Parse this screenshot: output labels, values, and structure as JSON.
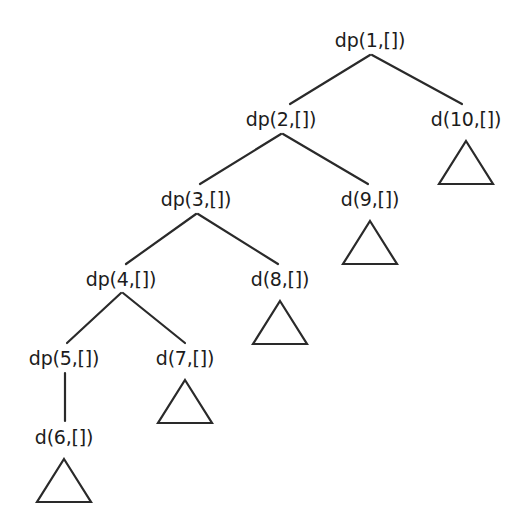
{
  "diagram": {
    "type": "derivation-tree",
    "title": "",
    "background_color": "#ffffff",
    "stroke_color": "#2a2a2a",
    "text_color": "#1c1c1c",
    "nodes": [
      {
        "id": "n1",
        "label": "dp(1,[])",
        "x": 370,
        "y": 40,
        "kind": "dp",
        "triangle": false
      },
      {
        "id": "n2",
        "label": "dp(2,[])",
        "x": 281,
        "y": 119,
        "kind": "dp",
        "triangle": false
      },
      {
        "id": "n10",
        "label": "d(10,[])",
        "x": 466,
        "y": 119,
        "kind": "d",
        "triangle": true
      },
      {
        "id": "n3",
        "label": "dp(3,[])",
        "x": 196,
        "y": 199,
        "kind": "dp",
        "triangle": false
      },
      {
        "id": "n9",
        "label": "d(9,[])",
        "x": 370,
        "y": 199,
        "kind": "d",
        "triangle": true
      },
      {
        "id": "n4",
        "label": "dp(4,[])",
        "x": 121,
        "y": 279,
        "kind": "dp",
        "triangle": false
      },
      {
        "id": "n8",
        "label": "d(8,[])",
        "x": 280,
        "y": 279,
        "kind": "d",
        "triangle": true
      },
      {
        "id": "n5",
        "label": "dp(5,[])",
        "x": 64,
        "y": 358,
        "kind": "dp",
        "triangle": false
      },
      {
        "id": "n7",
        "label": "d(7,[])",
        "x": 185,
        "y": 358,
        "kind": "d",
        "triangle": true
      },
      {
        "id": "n6",
        "label": "d(6,[])",
        "x": 64,
        "y": 437,
        "kind": "d",
        "triangle": true
      }
    ],
    "edges": [
      {
        "from": "n1",
        "to": "n2",
        "x1": 370,
        "y1": 55,
        "x2": 290,
        "y2": 104
      },
      {
        "from": "n1",
        "to": "n10",
        "x1": 372,
        "y1": 55,
        "x2": 462,
        "y2": 104
      },
      {
        "from": "n2",
        "to": "n3",
        "x1": 281,
        "y1": 134,
        "x2": 200,
        "y2": 184
      },
      {
        "from": "n2",
        "to": "n9",
        "x1": 283,
        "y1": 134,
        "x2": 368,
        "y2": 184
      },
      {
        "from": "n3",
        "to": "n4",
        "x1": 196,
        "y1": 214,
        "x2": 126,
        "y2": 264
      },
      {
        "from": "n3",
        "to": "n8",
        "x1": 198,
        "y1": 214,
        "x2": 278,
        "y2": 264
      },
      {
        "from": "n4",
        "to": "n5",
        "x1": 121,
        "y1": 293,
        "x2": 67,
        "y2": 343
      },
      {
        "from": "n4",
        "to": "n7",
        "x1": 123,
        "y1": 293,
        "x2": 185,
        "y2": 343
      },
      {
        "from": "n5",
        "to": "n6",
        "x1": 65,
        "y1": 373,
        "x2": 65,
        "y2": 421
      }
    ],
    "triangles": [
      {
        "node": "n10",
        "cx": 466,
        "top": 139,
        "width": 54,
        "height": 43
      },
      {
        "node": "n9",
        "cx": 370,
        "top": 219,
        "width": 54,
        "height": 43
      },
      {
        "node": "n8",
        "cx": 280,
        "top": 299,
        "width": 54,
        "height": 43
      },
      {
        "node": "n7",
        "cx": 185,
        "top": 378,
        "width": 54,
        "height": 43
      },
      {
        "node": "n6",
        "cx": 64,
        "top": 457,
        "width": 54,
        "height": 43
      }
    ]
  }
}
